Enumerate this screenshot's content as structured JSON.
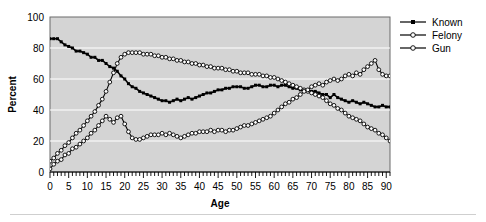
{
  "chart_data": {
    "type": "line",
    "title": "",
    "subtitle": "",
    "xlabel": "Age",
    "ylabel": "Percent",
    "xlim": [
      0,
      91
    ],
    "ylim": [
      0,
      100
    ],
    "xticks": [
      0,
      5,
      10,
      15,
      20,
      25,
      30,
      35,
      40,
      45,
      50,
      55,
      60,
      65,
      70,
      75,
      80,
      85,
      90
    ],
    "xtick_labels": [
      "0",
      "5",
      "10",
      "15",
      "20",
      "25",
      "30",
      "35",
      "40",
      "45",
      "50",
      "55",
      "60",
      "65",
      "70",
      "75",
      "80",
      "85",
      "90"
    ],
    "yticks": [
      0,
      20,
      40,
      60,
      80,
      100
    ],
    "ytick_labels": [
      "0",
      "20",
      "40",
      "60",
      "80",
      "100"
    ],
    "minor_xtick_step": 1,
    "grid": "horizontal-white",
    "plot_background": "#d4d4d4",
    "figure_background": "#ffffff",
    "legend_position": "right-outside",
    "x": [
      0,
      1,
      2,
      3,
      4,
      5,
      6,
      7,
      8,
      9,
      10,
      11,
      12,
      13,
      14,
      15,
      16,
      17,
      18,
      19,
      20,
      21,
      22,
      23,
      24,
      25,
      26,
      27,
      28,
      29,
      30,
      31,
      32,
      33,
      34,
      35,
      36,
      37,
      38,
      39,
      40,
      41,
      42,
      43,
      44,
      45,
      46,
      47,
      48,
      49,
      50,
      51,
      52,
      53,
      54,
      55,
      56,
      57,
      58,
      59,
      60,
      61,
      62,
      63,
      64,
      65,
      66,
      67,
      68,
      69,
      70,
      71,
      72,
      73,
      74,
      75,
      76,
      77,
      78,
      79,
      80,
      81,
      82,
      83,
      84,
      85,
      86,
      87,
      88,
      89,
      90,
      91
    ],
    "series": [
      {
        "name": "Known",
        "marker": "filled-square",
        "color": "#000000",
        "values": [
          86,
          86,
          86,
          84,
          82,
          81,
          80,
          78,
          78,
          77,
          76,
          74,
          74,
          72,
          72,
          70,
          68,
          67,
          65,
          62,
          60,
          57,
          55,
          54,
          52,
          51,
          50,
          49,
          48,
          47,
          46,
          46,
          45,
          46,
          47,
          46,
          47,
          48,
          47,
          48,
          49,
          50,
          51,
          51,
          52,
          53,
          53,
          54,
          54,
          55,
          55,
          55,
          54,
          54,
          55,
          56,
          56,
          55,
          55,
          56,
          56,
          55,
          56,
          56,
          55,
          54,
          54,
          53,
          53,
          52,
          52,
          52,
          51,
          50,
          50,
          48,
          50,
          48,
          47,
          46,
          45,
          46,
          45,
          44,
          45,
          44,
          43,
          42,
          42,
          43,
          42,
          42
        ]
      },
      {
        "name": "Felony",
        "marker": "open-circle",
        "color": "#000000",
        "values": [
          7,
          9,
          12,
          14,
          17,
          19,
          22,
          25,
          27,
          30,
          33,
          36,
          39,
          43,
          47,
          52,
          58,
          64,
          70,
          74,
          76,
          77,
          77,
          77,
          77,
          76,
          76,
          76,
          75,
          75,
          74,
          74,
          73,
          73,
          72,
          72,
          71,
          71,
          70,
          70,
          69,
          69,
          68,
          68,
          67,
          67,
          67,
          66,
          66,
          65,
          65,
          64,
          64,
          64,
          63,
          63,
          63,
          62,
          62,
          61,
          61,
          60,
          59,
          58,
          57,
          56,
          55,
          54,
          53,
          52,
          51,
          50,
          49,
          48,
          46,
          44,
          43,
          41,
          40,
          38,
          36,
          35,
          34,
          33,
          31,
          29,
          28,
          27,
          25,
          24,
          22,
          20
        ]
      },
      {
        "name": "Gun",
        "marker": "open-circle",
        "color": "#000000",
        "values": [
          2,
          5,
          7,
          8,
          11,
          12,
          15,
          16,
          18,
          20,
          22,
          25,
          27,
          30,
          33,
          36,
          34,
          32,
          35,
          36,
          31,
          26,
          22,
          21,
          21,
          22,
          23,
          24,
          24,
          24,
          25,
          24,
          25,
          24,
          23,
          22,
          23,
          24,
          25,
          25,
          26,
          26,
          26,
          27,
          26,
          27,
          27,
          26,
          27,
          27,
          28,
          29,
          30,
          30,
          31,
          32,
          33,
          34,
          35,
          36,
          38,
          40,
          42,
          44,
          45,
          47,
          48,
          50,
          52,
          53,
          55,
          56,
          57,
          56,
          58,
          59,
          60,
          59,
          60,
          62,
          63,
          62,
          64,
          63,
          66,
          68,
          70,
          72,
          66,
          63,
          62,
          62
        ]
      }
    ]
  },
  "legend": {
    "items": [
      {
        "label": "Known"
      },
      {
        "label": "Felony"
      },
      {
        "label": "Gun"
      }
    ]
  },
  "axes": {
    "x_title": "Age",
    "y_title": "Percent"
  }
}
